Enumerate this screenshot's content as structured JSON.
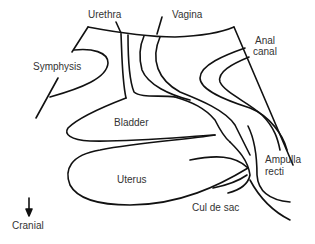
{
  "diagram": {
    "type": "anatomical-sagittal-section",
    "labels": {
      "urethra": "Urethra",
      "vagina": "Vagina",
      "anal_canal_line1": "Anal",
      "anal_canal_line2": "canal",
      "symphysis": "Symphysis",
      "bladder": "Bladder",
      "uterus": "Uterus",
      "ampulla_line1": "Ampulla",
      "ampulla_line2": "recti",
      "cul_de_sac": "Cul de sac",
      "orientation": "Cranial"
    },
    "orientation_arrow": "down-arrow-icon",
    "colors": {
      "line": "#111111",
      "text": "#333333",
      "background": "#ffffff"
    }
  }
}
